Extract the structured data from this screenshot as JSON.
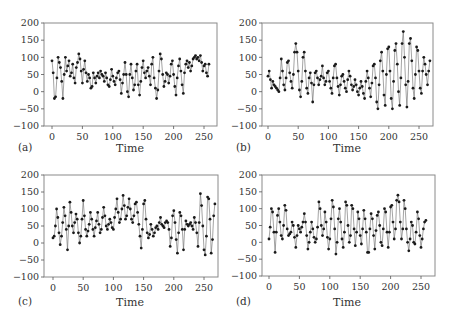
{
  "chart_data": [
    {
      "type": "line",
      "panel_label": "(a)",
      "title": "",
      "xlabel": "Time",
      "ylabel": "",
      "xlim": [
        0,
        260
      ],
      "ylim": [
        -100,
        200
      ],
      "xticks": [
        0,
        50,
        100,
        150,
        200,
        250
      ],
      "yticks": [
        -100,
        -50,
        0,
        50,
        100,
        150,
        200
      ],
      "ytick_labels": [
        "−100",
        "−50",
        "0",
        "50",
        "100",
        "150",
        "200"
      ],
      "grid": false,
      "markers": true,
      "x_step": 2,
      "series": [
        {
          "name": "a",
          "values": [
            90,
            55,
            -20,
            -15,
            40,
            100,
            85,
            70,
            30,
            -20,
            50,
            100,
            60,
            75,
            90,
            45,
            55,
            80,
            40,
            25,
            70,
            85,
            110,
            95,
            60,
            25,
            65,
            90,
            55,
            30,
            50,
            40,
            10,
            15,
            55,
            40,
            25,
            45,
            55,
            40,
            60,
            50,
            45,
            30,
            55,
            40,
            20,
            15,
            35,
            65,
            45,
            30,
            20,
            40,
            55,
            60,
            35,
            -5,
            25,
            50,
            85,
            50,
            0,
            -15,
            50,
            80,
            40,
            5,
            20,
            60,
            80,
            20,
            -10,
            30,
            70,
            90,
            55,
            40,
            60,
            70,
            45,
            20,
            80,
            100,
            40,
            10,
            -20,
            5,
            60,
            110,
            95,
            50,
            15,
            30,
            55,
            50,
            25,
            45,
            80,
            90,
            50,
            15,
            -10,
            40,
            75,
            95,
            60,
            20,
            -5,
            55,
            80,
            90,
            70,
            85,
            60,
            75,
            95,
            100,
            105,
            95,
            100,
            90,
            105,
            85,
            60,
            75,
            80,
            55,
            45,
            80
          ]
        }
      ]
    },
    {
      "type": "line",
      "panel_label": "(b)",
      "title": "",
      "xlabel": "Time",
      "ylabel": "",
      "xlim": [
        0,
        260
      ],
      "ylim": [
        -100,
        200
      ],
      "xticks": [
        0,
        50,
        100,
        150,
        200,
        250
      ],
      "yticks": [
        -100,
        -50,
        0,
        50,
        100,
        150,
        200
      ],
      "ytick_labels": [
        "−100",
        "−50",
        "0",
        "50",
        "100",
        "150",
        "200"
      ],
      "grid": false,
      "markers": true,
      "x_step": 2,
      "series": [
        {
          "name": "b",
          "values": [
            45,
            60,
            35,
            10,
            30,
            20,
            15,
            10,
            5,
            0,
            40,
            95,
            60,
            20,
            5,
            40,
            85,
            90,
            55,
            30,
            10,
            50,
            115,
            140,
            115,
            60,
            5,
            -15,
            30,
            100,
            115,
            60,
            10,
            -5,
            40,
            55,
            25,
            -30,
            20,
            55,
            60,
            40,
            20,
            35,
            45,
            75,
            40,
            20,
            30,
            55,
            60,
            30,
            10,
            -5,
            40,
            75,
            80,
            40,
            15,
            -10,
            20,
            45,
            50,
            30,
            10,
            0,
            35,
            60,
            45,
            20,
            5,
            15,
            35,
            20,
            0,
            -10,
            10,
            30,
            15,
            -5,
            -20,
            30,
            60,
            40,
            10,
            -15,
            25,
            75,
            80,
            40,
            -30,
            -50,
            20,
            90,
            115,
            60,
            -10,
            -40,
            50,
            125,
            130,
            60,
            -20,
            -50,
            30,
            120,
            140,
            80,
            0,
            -40,
            40,
            140,
            175,
            100,
            20,
            -45,
            30,
            140,
            155,
            90,
            10,
            -20,
            50,
            130,
            120,
            60,
            10,
            -5,
            60,
            100,
            80,
            50,
            20,
            60,
            90
          ]
        }
      ]
    },
    {
      "type": "line",
      "panel_label": "(c)",
      "title": "",
      "xlabel": "Time",
      "ylabel": "",
      "xlim": [
        0,
        260
      ],
      "ylim": [
        -100,
        200
      ],
      "xticks": [
        0,
        50,
        100,
        150,
        200,
        250
      ],
      "yticks": [
        -100,
        -50,
        0,
        50,
        100,
        150,
        200
      ],
      "ytick_labels": [
        "−100",
        "−50",
        "0",
        "50",
        "100",
        "150",
        "200"
      ],
      "grid": false,
      "markers": true,
      "x_step": 2,
      "series": [
        {
          "name": "c",
          "values": [
            15,
            20,
            50,
            100,
            75,
            30,
            -5,
            20,
            60,
            105,
            80,
            40,
            -20,
            50,
            120,
            90,
            50,
            30,
            60,
            85,
            70,
            30,
            0,
            20,
            70,
            125,
            80,
            40,
            20,
            35,
            55,
            90,
            70,
            40,
            20,
            45,
            65,
            90,
            55,
            30,
            40,
            75,
            105,
            80,
            50,
            40,
            55,
            70,
            60,
            45,
            40,
            75,
            100,
            130,
            90,
            60,
            70,
            100,
            140,
            110,
            70,
            80,
            105,
            130,
            100,
            70,
            60,
            80,
            115,
            120,
            90,
            55,
            20,
            -15,
            40,
            115,
            125,
            70,
            30,
            15,
            25,
            55,
            40,
            20,
            30,
            45,
            50,
            40,
            60,
            75,
            55,
            50,
            45,
            60,
            65,
            60,
            40,
            -10,
            15,
            80,
            95,
            60,
            10,
            -30,
            30,
            90,
            80,
            40,
            -20,
            40,
            65,
            55,
            50,
            55,
            60,
            50,
            40,
            75,
            60,
            30,
            -10,
            60,
            145,
            110,
            50,
            -20,
            -35,
            20,
            135,
            130,
            70,
            -30,
            10,
            80,
            115
          ]
        }
      ]
    },
    {
      "type": "line",
      "panel_label": "(d)",
      "title": "",
      "xlabel": "Time",
      "ylabel": "",
      "xlim": [
        0,
        260
      ],
      "ylim": [
        -100,
        200
      ],
      "xticks": [
        0,
        50,
        100,
        150,
        200,
        250
      ],
      "yticks": [
        -100,
        -50,
        0,
        50,
        100,
        150,
        200
      ],
      "ytick_labels": [
        "−100",
        "−50",
        "0",
        "50",
        "100",
        "150",
        "200"
      ],
      "grid": false,
      "markers": true,
      "x_step": 2,
      "series": [
        {
          "name": "d",
          "values": [
            10,
            45,
            100,
            90,
            30,
            -30,
            30,
            80,
            100,
            60,
            20,
            10,
            50,
            110,
            95,
            40,
            20,
            25,
            30,
            60,
            50,
            15,
            -15,
            20,
            50,
            40,
            30,
            45,
            60,
            85,
            60,
            20,
            -20,
            0,
            30,
            60,
            40,
            15,
            0,
            10,
            45,
            120,
            100,
            50,
            20,
            40,
            90,
            60,
            15,
            -20,
            10,
            70,
            125,
            105,
            40,
            -35,
            0,
            70,
            100,
            60,
            10,
            -15,
            30,
            120,
            110,
            50,
            0,
            20,
            110,
            100,
            40,
            -10,
            30,
            90,
            70,
            20,
            -5,
            40,
            95,
            70,
            30,
            -30,
            -30,
            40,
            85,
            70,
            20,
            -20,
            35,
            80,
            90,
            50,
            0,
            -10,
            40,
            100,
            90,
            30,
            -15,
            30,
            105,
            110,
            60,
            10,
            40,
            125,
            140,
            120,
            60,
            10,
            40,
            125,
            100,
            40,
            0,
            -25,
            10,
            60,
            50,
            0,
            -5,
            30,
            90,
            70,
            20,
            -15,
            10,
            40,
            60,
            65
          ]
        }
      ]
    }
  ]
}
